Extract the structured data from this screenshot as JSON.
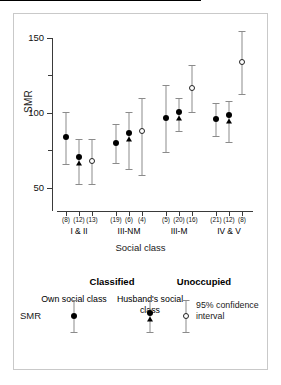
{
  "chart_data": {
    "type": "scatter",
    "title": "",
    "xlabel": "Social class",
    "ylabel": "SMR",
    "ylim": [
      30,
      155
    ],
    "yticks": [
      50,
      100,
      150
    ],
    "yticklabels": [
      "50",
      "100",
      "150"
    ],
    "yminorticks": [
      75,
      125
    ],
    "reference_line": 100,
    "grid": false,
    "categories": [
      "I & II",
      "III-NM",
      "III-M",
      "IV & V"
    ],
    "series": [
      {
        "name": "Own social class",
        "marker": "filled-circle",
        "values": [
          84,
          80,
          97,
          96
        ],
        "ci_low": [
          66,
          67,
          74,
          85
        ],
        "ci_high": [
          101,
          93,
          119,
          107
        ]
      },
      {
        "name": "Husband's social class",
        "marker": "filled-circle-triangle",
        "values": [
          69,
          85,
          99,
          97
        ],
        "ci_low": [
          53,
          63,
          88,
          81
        ],
        "ci_high": [
          83,
          101,
          110,
          108
        ]
      },
      {
        "name": "Unoccupied",
        "marker": "open-circle",
        "values": [
          68,
          88,
          117,
          134
        ],
        "ci_low": [
          53,
          59,
          101,
          113
        ],
        "ci_high": [
          83,
          110,
          132,
          155
        ]
      }
    ],
    "point_counts": [
      [
        "(8)",
        "(12)",
        "(13)"
      ],
      [
        "(19)",
        "(6)",
        "(4)"
      ],
      [
        "(5)",
        "(20)",
        "(16)"
      ],
      [
        "(21)",
        "(12)",
        "(8)"
      ]
    ],
    "annotations": []
  },
  "axes": {
    "y_title": "SMR",
    "x_title": "Social class",
    "y_labels": [
      "150",
      "100",
      "50"
    ]
  },
  "group_labels": [
    "I & II",
    "III-NM",
    "III-M",
    "IV & V"
  ],
  "counts_flat": [
    "(8)",
    "(12)",
    "(13)",
    "(19)",
    "(6)",
    "(4)",
    "(5)",
    "(20)",
    "(16)",
    "(21)",
    "(12)",
    "(8)"
  ],
  "legend": {
    "heading_classified": "Classified",
    "heading_unoccupied": "Unoccupied",
    "sub_own": "Own social class",
    "sub_husband": "Husband's social class",
    "row_label": "SMR",
    "ci_text": "95% confidence interval"
  },
  "colors": {
    "marker_fill": "#000000",
    "marker_open_edge": "#222222",
    "whisker": "#8b8b8b",
    "axis": "#3a3a3a",
    "reference_line": "#000000",
    "frame": "#c9c9c9",
    "background": "#ffffff"
  }
}
